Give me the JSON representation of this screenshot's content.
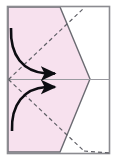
{
  "figure": {
    "title": "Origami fold step diagram",
    "type": "origami-instruction-diagram",
    "caption": "",
    "canvas": {
      "width": 117,
      "height": 161
    }
  },
  "colors": {
    "paper_fill": "#f7e1ee",
    "paper_stroke": "#6b6b72",
    "frame_stroke": "#8b8b90",
    "fold_line": "#5f5f66",
    "arrow": "#0d0d12",
    "background": "#ffffff",
    "center_line": "#9a9aa0"
  },
  "frame": {
    "label": "outer page frame",
    "x": 7.5,
    "y": 6.5,
    "width": 102,
    "height": 147,
    "stroke_width": 1.6
  },
  "paper": {
    "label": "folded paper silhouette",
    "points": "8,7 60,7 90,79 60,152 8,152",
    "description": "Rectangle whose right side has been folded into a point at mid-height"
  },
  "center_line": {
    "label": "horizontal center crease",
    "x1": 8,
    "y1": 79.5,
    "x2": 110,
    "y2": 79.5
  },
  "fold_lines": [
    {
      "name": "upper-valley-fold",
      "style": "dashed",
      "x1": 8.5,
      "y1": 79.5,
      "x2": 84,
      "y2": 8
    },
    {
      "name": "lower-valley-fold",
      "style": "dashed",
      "x1": 8.5,
      "y1": 79.5,
      "x2": 84,
      "y2": 151
    },
    {
      "name": "lower-right-extension-fold",
      "style": "dashed",
      "x1": 84,
      "y1": 151,
      "x2": 110,
      "y2": 153
    }
  ],
  "arrows": [
    {
      "name": "upper-fold-arrow",
      "direction": "right",
      "path": "M 11,28 C 11,55 22,72 44,74",
      "tip": {
        "x": 62,
        "y": 74
      },
      "description": "Top-left flap folds down and to the right"
    },
    {
      "name": "lower-fold-arrow",
      "direction": "right",
      "path": "M 12,131 C 12,105 23,89 44,87",
      "tip": {
        "x": 62,
        "y": 87
      },
      "description": "Bottom-left flap folds up and to the right"
    }
  ],
  "annotations": []
}
